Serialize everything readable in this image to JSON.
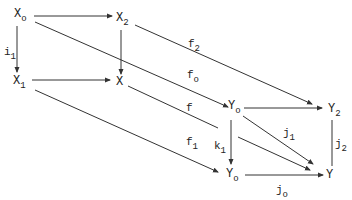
{
  "diagram": {
    "type": "commutative-diagram",
    "colors": {
      "stroke": "#333333",
      "text": "#222222",
      "background": "#ffffff"
    },
    "nodes": [
      {
        "id": "X0",
        "base": "X",
        "sub": "o"
      },
      {
        "id": "X2",
        "base": "X",
        "sub": "2"
      },
      {
        "id": "X1",
        "base": "X",
        "sub": "1"
      },
      {
        "id": "X",
        "base": "X",
        "sub": ""
      },
      {
        "id": "Y0t",
        "base": "Y",
        "sub": "o"
      },
      {
        "id": "Y2",
        "base": "Y",
        "sub": "2"
      },
      {
        "id": "Y0b",
        "base": "Y",
        "sub": "o"
      },
      {
        "id": "Y",
        "base": "Y",
        "sub": ""
      }
    ],
    "edges": [
      {
        "from": "X0",
        "to": "X2",
        "label": ""
      },
      {
        "from": "X0",
        "to": "X1",
        "label_base": "i",
        "label_sub": "1"
      },
      {
        "from": "X2",
        "to": "X",
        "label": ""
      },
      {
        "from": "X1",
        "to": "X",
        "label": ""
      },
      {
        "from": "X2",
        "to": "Y2",
        "label_base": "f",
        "label_sub": "2"
      },
      {
        "from": "X0",
        "to": "Y0t",
        "label_base": "f",
        "label_sub": "o"
      },
      {
        "from": "X",
        "to": "Y",
        "label_base": "f",
        "label_sub": ""
      },
      {
        "from": "X1",
        "to": "Y0b",
        "label_base": "f",
        "label_sub": "1"
      },
      {
        "from": "Y0t",
        "to": "Y2",
        "label": ""
      },
      {
        "from": "Y0t",
        "to": "Y0b",
        "label_base": "k",
        "label_sub": "1"
      },
      {
        "from": "Y0t",
        "to": "Y",
        "label_base": "j",
        "label_sub": "1"
      },
      {
        "from": "Y2",
        "to": "Y",
        "label_base": "j",
        "label_sub": "2"
      },
      {
        "from": "Y0b",
        "to": "Y",
        "label_base": "j",
        "label_sub": "o"
      }
    ]
  }
}
